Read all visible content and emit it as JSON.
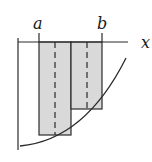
{
  "diagram": {
    "type": "riemann-sum-midpoint",
    "labels": {
      "a": "a",
      "b": "b",
      "x_axis": "x"
    },
    "colors": {
      "stroke": "#2a2a2a",
      "rect_fill": "#d9d9d9",
      "background": "#ffffff"
    },
    "rectangles": [
      {
        "name": "left",
        "x0": 39,
        "x1": 71,
        "y0": 42,
        "y1": 135,
        "midline_x": 55
      },
      {
        "name": "right",
        "x0": 71,
        "x1": 102,
        "y0": 42,
        "y1": 109,
        "midline_x": 87
      }
    ],
    "axes": {
      "x_axis_y": 42,
      "x_axis_x0": 18,
      "x_axis_x1": 128,
      "y_axis_x": 18,
      "y_axis_y0": 38,
      "y_axis_y1": 150
    },
    "curve": {
      "description": "increasing convex curve below x-axis",
      "from": [
        20,
        146
      ],
      "to": [
        126,
        58
      ]
    }
  }
}
